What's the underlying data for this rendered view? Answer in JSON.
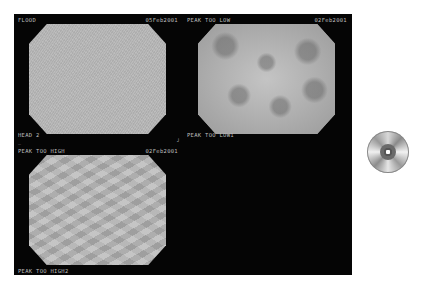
{
  "panels": [
    {
      "id": "flood",
      "top_left": "FLOOD",
      "top_right": "05Feb2001",
      "bottom_left": "HEAD 2",
      "pattern": "flood"
    },
    {
      "id": "peak-too-low",
      "top_left": "PEAK TOO LOW",
      "top_right": "02Feb2001",
      "bottom_left": "PEAK TOO LOW1",
      "pattern": "low"
    },
    {
      "id": "peak-too-high",
      "top_left": "PEAK TOO HIGH",
      "top_right": "02Feb2001",
      "bottom_left": "PEAK TOO HIGH2",
      "pattern": "high"
    }
  ],
  "cursor_glyph": "┘",
  "icons": {
    "disc": "cd-disc-icon"
  },
  "colors": {
    "monitor_bg": "#050505",
    "label": "#bdbdbd",
    "page_bg": "#ffffff"
  }
}
